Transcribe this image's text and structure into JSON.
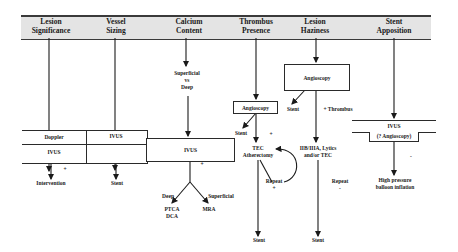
{
  "headers": [
    {
      "label": "Lesion\nSignificance"
    },
    {
      "label": "Vessel\nSizing"
    },
    {
      "label": "Calcium\nContent"
    },
    {
      "label": "Thrombus\nPresence"
    },
    {
      "label": "Lesion\nHaziness"
    },
    {
      "label": "Stent\nApposition"
    }
  ],
  "lesion_significance": {
    "box_top": "Doppler",
    "box_bottom": "IVUS",
    "sign": "+",
    "outcome": "Intervention"
  },
  "vessel_sizing": {
    "box": "IVUS",
    "outcome": "Stent"
  },
  "calcium_content": {
    "question": "Superficial\nvs\nDeep",
    "box": "IVUS",
    "sign": "+",
    "branch_left_label": "Deep",
    "branch_right_label": "Superficial",
    "outcome_left": "PTCA\nDCA",
    "outcome_right": "MRA"
  },
  "thrombus_presence": {
    "box": "Angioscopy",
    "neg_outcome": "Stent",
    "sign_pos": "+",
    "procedure": "TEC\nAtherectomy",
    "loop_label": "Repeat\n+",
    "outcome": "Stent"
  },
  "lesion_haziness": {
    "box": "Angioscopy",
    "neg_outcome": "Stent",
    "pos_label": "+ Thrombus",
    "procedure": "IIB/IIIA, Lytics\nand/or TEC",
    "repeat_label": "Repeat\n-",
    "outcome": "Stent"
  },
  "stent_apposition": {
    "box_top": "IVUS",
    "box_bottom": "(? Angioscopy)",
    "sign": "-",
    "outcome": "High pressure\nballoon inflation"
  }
}
